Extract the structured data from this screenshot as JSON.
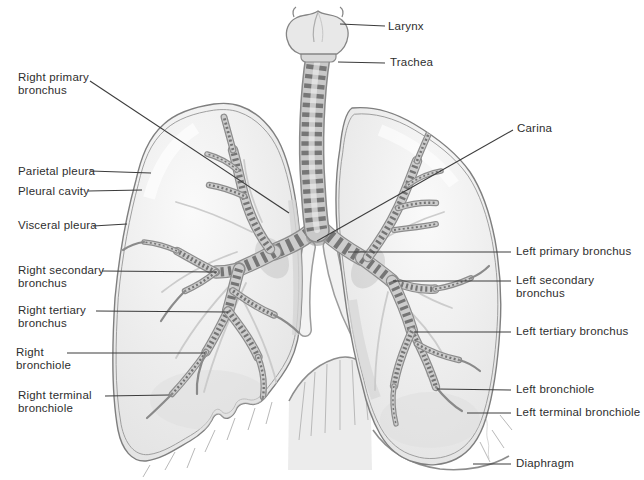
{
  "figure_type": "anatomical diagram of the human lower respiratory system (anterior view)",
  "labels": {
    "larynx": "Larynx",
    "trachea": "Trachea",
    "carina": "Carina",
    "right_primary_bronchus": "Right primary\nbronchus",
    "parietal_pleura": "Parietal pleura",
    "pleural_cavity": "Pleural cavity",
    "visceral_pleura": "Visceral pleura",
    "right_secondary_bronchus": "Right secondary\nbronchus",
    "right_tertiary_bronchus": "Right tertiary\nbronchus",
    "right_bronchiole": "Right\nbronchiole",
    "right_terminal_bronchiole": "Right terminal\nbronchiole",
    "left_primary_bronchus": "Left primary bronchus",
    "left_secondary_bronchus": "Left secondary\nbronchus",
    "left_tertiary_bronchus": "Left tertiary bronchus",
    "left_bronchiole": "Left bronchiole",
    "left_terminal_bronchiole": "Left terminal bronchiole",
    "diaphragm": "Diaphragm"
  },
  "colors": {
    "background": "#ffffff",
    "label_text": "#2e2e2e",
    "leader_line": "#3c3c3c",
    "lung_fill": "#ebebeb",
    "lung_outline": "#7f7f7f",
    "cartilage_ring": "#6b6b6b"
  }
}
